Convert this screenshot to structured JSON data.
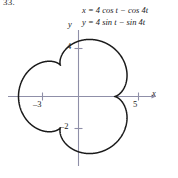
{
  "figure": {
    "problem_number": "33.",
    "equations": {
      "line1": "x = 4 cos t − cos 4t",
      "line2": "y = 4 sin t − sin 4t"
    },
    "axis_labels": {
      "x": "x",
      "y": "y"
    },
    "tick_labels": {
      "y_positive": "4",
      "y_negative": "–2",
      "x_negative": "–3",
      "x_positive": "5"
    },
    "colors": {
      "curve": "#1a1a1a",
      "axis": "#8f8fa8",
      "text": "#1b1b1b",
      "background": "#ffffff"
    }
  },
  "chart_data": {
    "type": "line",
    "title": "",
    "subtitle": "",
    "xlabel": "x",
    "ylabel": "y",
    "parametric": true,
    "equations": {
      "x": "x = 4 cos t − cos 4t",
      "y": "y = 4 sin t − sin 4t"
    },
    "parameter": "t",
    "parameter_range": [
      0,
      6.283185307179586
    ],
    "xlim": [
      -5.8,
      6.4
    ],
    "ylim": [
      -5.6,
      5.6
    ],
    "grid": false,
    "legend": null,
    "xticks": [
      -3,
      5
    ],
    "xticklabels": [
      "–3",
      "5"
    ],
    "yticks": [
      4,
      -2
    ],
    "yticklabels": [
      "4",
      "–2"
    ],
    "curve_description": "epitrochoid with 5 cusps; radius varies between 3 and 5",
    "cusps": 5,
    "r_min": 3,
    "r_max": 5,
    "points_t": [
      0,
      0.2,
      0.4,
      0.6,
      0.8,
      1.0,
      1.2,
      1.4,
      1.6,
      1.8,
      2.0,
      2.2,
      2.4,
      2.6,
      2.8,
      3.0,
      3.2,
      3.4,
      3.6,
      3.8,
      4.0,
      4.2,
      4.4,
      4.6,
      4.8,
      5.0,
      5.2,
      5.4,
      5.6,
      5.8,
      6.0,
      6.283185307179586
    ],
    "points_x": [
      3.0,
      3.23,
      3.56,
      3.19,
      2.12,
      1.16,
      0.87,
      0.99,
      0.65,
      -0.49,
      -1.99,
      -3.06,
      -3.3,
      -2.96,
      -2.69,
      -3.0,
      -3.78,
      -4.42,
      -4.33,
      -3.48,
      -2.44,
      -1.97,
      -2.4,
      -3.22,
      -3.55,
      -2.97,
      -1.76,
      -0.69,
      -0.41,
      -0.9,
      -1.38,
      3.0
    ],
    "points_y": [
      0.0,
      1.58,
      2.85,
      3.66,
      4.04,
      4.18,
      4.26,
      4.29,
      3.99,
      3.11,
      1.84,
      0.72,
      0.25,
      0.45,
      0.68,
      0.29,
      -0.83,
      -2.35,
      -3.66,
      -4.25,
      -4.05,
      -3.54,
      -3.3,
      -3.53,
      -3.75,
      -3.42,
      -2.67,
      -2.13,
      -2.35,
      -3.12,
      -3.63,
      0.0
    ]
  }
}
